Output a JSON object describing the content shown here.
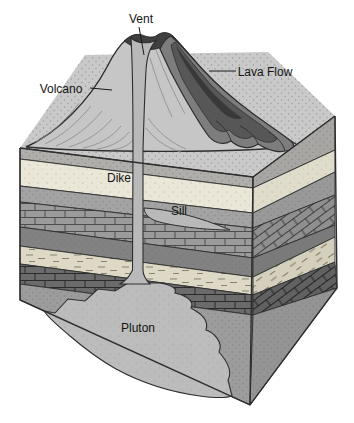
{
  "diagram": {
    "labels": {
      "vent": "Vent",
      "lava_flow": "Lava Flow",
      "volcano": "Volcano",
      "dike": "Dike",
      "sill": "Sill",
      "pluton": "Pluton"
    },
    "colors": {
      "background": "#ffffff",
      "line": "#2e2e2e",
      "volcano_flank": "#c6c6c6",
      "contour_line": "#8a8a8a",
      "lava_outer": "#7d7d7d",
      "lava_mid": "#575757",
      "lava_core": "#393939",
      "magma_gray": "#b9b9b9",
      "surface": "#c9c9c9",
      "layer_cream": "#eae6d8",
      "layer_gray": "#a3a3a3",
      "layer_brick": "#9b9b9b",
      "layer_dark": "#828282",
      "layer_shale": "#ded9c7",
      "layer_brick_dark": "#6b6b6b",
      "country_rock": "#9c9c9c",
      "pluton_fill": "#bcbcbc"
    }
  }
}
